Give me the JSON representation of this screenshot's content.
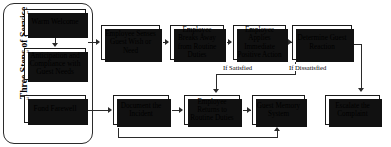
{
  "diagram": {
    "group": {
      "label": "Three Steps of Service",
      "steps": [
        {
          "num": "1",
          "label": "Warm Welcome"
        },
        {
          "num": "2",
          "label": "Anticipation and Compliance with Guest Needs"
        },
        {
          "num": "3",
          "label": "Fond Farewell"
        }
      ]
    },
    "top_row": [
      {
        "label": "Employee Senses Guest Wish or Need"
      },
      {
        "label": "Employee Breaks Away from Routine Duties"
      },
      {
        "label": "Employee Applies Immediate Positive Action"
      },
      {
        "label": "Determine Guest Reaction"
      }
    ],
    "bottom_row": [
      {
        "label": "Document the Incident"
      },
      {
        "label": "Employee Returns to Routine Duties"
      },
      {
        "label": "Guest Memory System"
      },
      {
        "label": "Escalate the Complaint"
      }
    ],
    "edge_labels": {
      "satisfied": "If Satisfied",
      "dissatisfied": "If Dissatisfied"
    },
    "colors": {
      "box_border": "#1a1a1a",
      "box_fill": "#ffffff",
      "shadow": "#111111",
      "connector": "#2a2a2a",
      "text": "#000000",
      "panel_border": "#2b2b2b"
    }
  }
}
